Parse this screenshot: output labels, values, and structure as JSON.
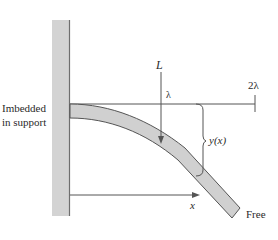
{
  "diagram": {
    "type": "cantilever-beam",
    "colors": {
      "wall_fill": "#d3d3d3",
      "wall_edge": "#6e6e6e",
      "beam_fill": "#d0d0d0",
      "beam_edge": "#555555",
      "line": "#555555",
      "text": "#2a2a2a"
    },
    "labels": {
      "support_line1": "Imbedded",
      "support_line2": "in support",
      "load": "L",
      "lambda": "λ",
      "two_lambda": "2λ",
      "deflection": "y(x)",
      "x_axis": "x",
      "free_end": "Free"
    },
    "elements": [
      {
        "name": "wall",
        "kind": "support"
      },
      {
        "name": "beam",
        "kind": "deflected beam"
      },
      {
        "name": "reference-line",
        "kind": "horizontal line with end tick"
      },
      {
        "name": "load-arrow",
        "kind": "downward arrow"
      },
      {
        "name": "deflection-brace",
        "kind": "brace"
      },
      {
        "name": "x-arrow",
        "kind": "horizontal arrow"
      }
    ]
  }
}
